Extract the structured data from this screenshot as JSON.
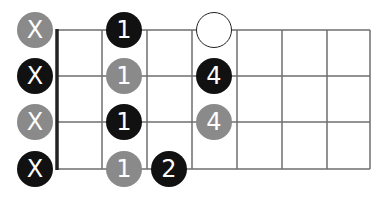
{
  "diagram": {
    "type": "guitar-fretboard",
    "strings": 4,
    "frets": 7,
    "colors": {
      "black": "#111111",
      "gray": "#8a8a8a",
      "grid": "#6e6e6e",
      "nut": "#222222"
    },
    "muted_markers": [
      {
        "row": 0,
        "label": "X",
        "color": "gray"
      },
      {
        "row": 1,
        "label": "X",
        "color": "black"
      },
      {
        "row": 2,
        "label": "X",
        "color": "gray"
      },
      {
        "row": 3,
        "label": "X",
        "color": "black"
      }
    ],
    "notes": [
      {
        "row": 0,
        "fret": 1,
        "label": "1",
        "color": "black"
      },
      {
        "row": 1,
        "fret": 1,
        "label": "1",
        "color": "gray"
      },
      {
        "row": 2,
        "fret": 1,
        "label": "1",
        "color": "black"
      },
      {
        "row": 3,
        "fret": 1,
        "label": "1",
        "color": "gray"
      },
      {
        "row": 3,
        "fret": 2,
        "label": "2",
        "color": "black"
      },
      {
        "row": 0,
        "fret": 3,
        "label": "",
        "color": "open"
      },
      {
        "row": 1,
        "fret": 3,
        "label": "4",
        "color": "black"
      },
      {
        "row": 2,
        "fret": 3,
        "label": "4",
        "color": "gray"
      }
    ]
  }
}
